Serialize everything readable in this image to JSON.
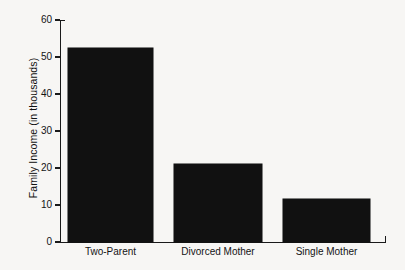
{
  "chart_data": {
    "type": "bar",
    "title": "",
    "subtitle": "",
    "xlabel": "",
    "ylabel": "Family Income (in thousands)",
    "categories": [
      "Two-Parent",
      "Divorced Mother",
      "Single Mother"
    ],
    "values": [
      52.5,
      21,
      11.5
    ],
    "ylim": [
      0,
      60
    ],
    "yticks": [
      0,
      10,
      20,
      30,
      40,
      50,
      60
    ],
    "ytick_labels": [
      "0",
      "10",
      "20",
      "30",
      "40",
      "50",
      "60"
    ],
    "grid": false,
    "legend": null,
    "bar_color": "#111111",
    "background_color": "#f7f6f4",
    "axis_color": "#1a1a1a"
  },
  "axis": {
    "y_title": "Family Income (in thousands)"
  }
}
